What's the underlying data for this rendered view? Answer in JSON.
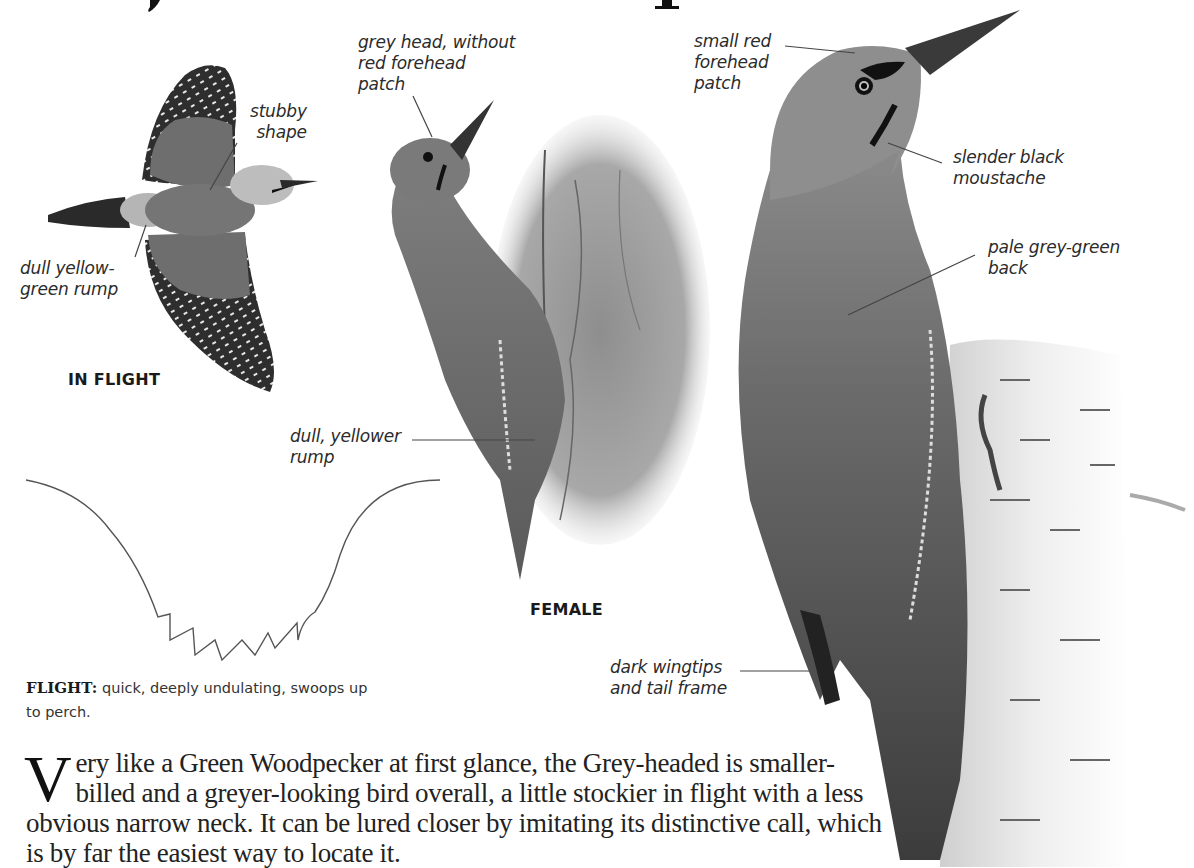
{
  "page": {
    "title_fragment_descenders": [
      "y",
      "p"
    ]
  },
  "flight_illustration": {
    "caption": "IN FLIGHT",
    "labels": {
      "stubby_shape": "stubby\nshape",
      "rump": "dull yellow-\ngreen rump"
    }
  },
  "female_illustration": {
    "caption": "FEMALE",
    "labels": {
      "grey_head": "grey head, without\nred forehead\npatch",
      "rump": "dull, yellower\nrump"
    }
  },
  "male_illustration": {
    "labels": {
      "forehead": "small red\nforehead\npatch",
      "moustache": "slender black\nmoustache",
      "back": "pale grey-green\nback",
      "wingtips": "dark wingtips\nand tail frame"
    }
  },
  "flight_pattern": {
    "heading": "FLIGHT:",
    "text": " quick, deeply undulating, swoops up to perch."
  },
  "description": {
    "dropcap": "V",
    "text": "ery like a Green Woodpecker at first glance, the Grey-headed is smaller-billed and a greyer-looking bird overall, a little stockier in flight with a less obvious narrow neck. It can be lured closer by imitating its distinctive call, which is by far the easiest way to locate it."
  },
  "colors": {
    "text": "#231f20",
    "leader_line": "#555555",
    "bird_grey": "#7a7a7a",
    "bird_dark": "#3a3a3a",
    "bark": "#9a9a9a",
    "birch": "#e6e6e6"
  }
}
